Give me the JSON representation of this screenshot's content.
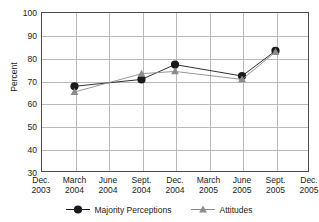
{
  "chart_data": {
    "type": "line",
    "title": "",
    "xlabel": "",
    "ylabel": "Percent",
    "ylim": [
      30,
      100
    ],
    "ytick_values": [
      100,
      90,
      80,
      70,
      60,
      50,
      40,
      30
    ],
    "grid": true,
    "legend_position": "bottom",
    "categories": [
      "Dec. 2003",
      "March 2004",
      "June 2004",
      "Sept. 2004",
      "Dec. 2004",
      "March 2005",
      "June 2005",
      "Sept. 2005",
      "Dec. 2005"
    ],
    "category_lines": [
      [
        "Dec.",
        "2003"
      ],
      [
        "March",
        "2004"
      ],
      [
        "June",
        "2004"
      ],
      [
        "Sept.",
        "2004"
      ],
      [
        "Dec.",
        "2004"
      ],
      [
        "March",
        "2005"
      ],
      [
        "June",
        "2005"
      ],
      [
        "Sept.",
        "2005"
      ],
      [
        "Dec.",
        "2005"
      ]
    ],
    "series": [
      {
        "name": "Majority Perceptions",
        "marker": "circle",
        "color": "#1a1a1a",
        "values": [
          null,
          67.5,
          null,
          70.5,
          77.0,
          null,
          72.0,
          83.0,
          null
        ]
      },
      {
        "name": "Attitudes",
        "marker": "triangle",
        "color": "#8c8c8c",
        "values": [
          null,
          65.0,
          null,
          73.0,
          74.0,
          null,
          70.5,
          82.5,
          null
        ]
      }
    ]
  },
  "axis": {
    "ylabel": "Percent",
    "yticks": [
      "100",
      "90",
      "80",
      "70",
      "60",
      "50",
      "40",
      "30"
    ]
  },
  "legend": {
    "items": [
      {
        "label": "Majority Perceptions",
        "marker": "circle-marker-icon",
        "color": "#1a1a1a"
      },
      {
        "label": "Attitudes",
        "marker": "triangle-marker-icon",
        "color": "#8c8c8c"
      }
    ]
  },
  "top_clipped_text": ""
}
